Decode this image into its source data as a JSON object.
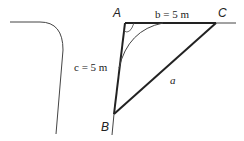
{
  "diagram": {
    "vertices": {
      "A": {
        "label": "A",
        "x": 125,
        "y": 23
      },
      "B": {
        "label": "B",
        "x": 114,
        "y": 114
      },
      "C": {
        "label": "C",
        "x": 216,
        "y": 23
      }
    },
    "sides": {
      "b": "b = 5 m",
      "c": "c = 5 m",
      "a": "a"
    },
    "colors": {
      "stroke": "#222222",
      "thin": "#444444"
    }
  }
}
